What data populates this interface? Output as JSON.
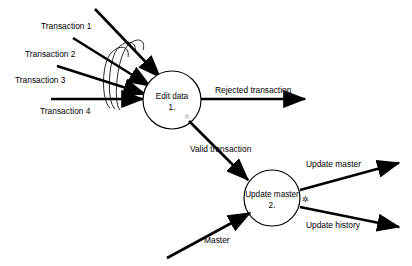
{
  "diagram": {
    "type": "data-flow-diagram",
    "background_color": "#ffffff",
    "line_color": "#000000",
    "processes": [
      {
        "id": "edit-data",
        "name_line": "Edit data",
        "number_line": "1.",
        "cx": 172,
        "cy": 100,
        "r": 29
      },
      {
        "id": "update-master",
        "name_line": "Update master",
        "number_line": "2.",
        "cx": 272,
        "cy": 198,
        "r": 28
      }
    ],
    "inputs_top": [
      {
        "id": "transaction-1",
        "label": "Transaction 1"
      },
      {
        "id": "transaction-2",
        "label": "Transaction 2"
      },
      {
        "id": "transaction-3",
        "label": "Transaction 3"
      },
      {
        "id": "transaction-4",
        "label": "Transaction 4"
      }
    ],
    "flows": [
      {
        "id": "rejected-transaction",
        "label": "Rejected transaction"
      },
      {
        "id": "valid-transaction",
        "label": "Valid transaction"
      },
      {
        "id": "master",
        "label": "Master"
      },
      {
        "id": "update-master-out",
        "label": "Update master"
      },
      {
        "id": "update-history-out",
        "label": "Update history"
      }
    ],
    "markers": [
      {
        "id": "edit-data-marker",
        "glyph": "✲",
        "x": 187,
        "y": 118,
        "style": "faint"
      },
      {
        "id": "update-master-marker",
        "glyph": "✲",
        "x": 305,
        "y": 199,
        "style": "dark"
      }
    ]
  }
}
